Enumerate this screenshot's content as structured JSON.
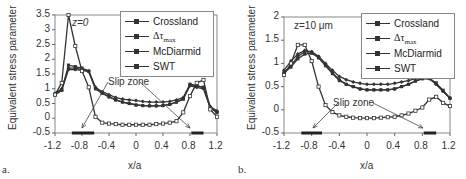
{
  "chart_data": [
    {
      "panel": "a.",
      "type": "line",
      "title": "",
      "annotation": "z=0",
      "slip_zone_label": "Slip zone",
      "xlabel": "x/a",
      "ylabel": "Equivalent stress parameter",
      "xlim": [
        -1.2,
        1.2
      ],
      "ylim": [
        -0.5,
        3.5
      ],
      "xticks": [
        "-1.2",
        "-0.8",
        "-0.4",
        "0",
        "0.4",
        "0.8",
        "1.2"
      ],
      "yticks": [
        "-0.5",
        "0",
        "0.5",
        "1",
        "1.5",
        "2",
        "2.5",
        "3",
        "3.5"
      ],
      "legend_position": "upper right",
      "grid": false,
      "x": [
        -1.2,
        -1.1,
        -1.0,
        -0.9,
        -0.8,
        -0.7,
        -0.6,
        -0.5,
        -0.4,
        -0.3,
        -0.2,
        -0.1,
        0.0,
        0.1,
        0.2,
        0.3,
        0.4,
        0.5,
        0.6,
        0.7,
        0.8,
        0.9,
        1.0,
        1.1,
        1.2
      ],
      "series": [
        {
          "name": "Crossland",
          "values": [
            0.85,
            1.0,
            1.7,
            1.7,
            1.65,
            1.6,
            1.05,
            0.9,
            0.8,
            0.7,
            0.65,
            0.62,
            0.6,
            0.57,
            0.55,
            0.55,
            0.55,
            0.57,
            0.62,
            0.7,
            1.15,
            1.1,
            1.05,
            0.4,
            0.25
          ]
        },
        {
          "name": "Δτmax",
          "values": [
            0.8,
            0.95,
            1.65,
            1.65,
            1.62,
            1.58,
            1.0,
            0.85,
            0.72,
            0.62,
            0.55,
            0.5,
            0.45,
            0.43,
            0.42,
            0.42,
            0.43,
            0.47,
            0.55,
            0.65,
            1.1,
            1.05,
            1.0,
            0.35,
            0.2
          ]
        },
        {
          "name": "McDiarmid",
          "values": [
            0.8,
            0.95,
            1.8,
            1.75,
            1.7,
            1.6,
            1.0,
            0.85,
            0.73,
            0.62,
            0.55,
            0.5,
            0.45,
            0.43,
            0.42,
            0.42,
            0.43,
            0.47,
            0.55,
            0.65,
            1.15,
            1.1,
            1.05,
            0.35,
            0.2
          ]
        },
        {
          "name": "SWT",
          "values": [
            0.8,
            1.2,
            3.5,
            2.45,
            1.6,
            1.05,
            0.05,
            -0.15,
            -0.18,
            -0.2,
            -0.22,
            -0.22,
            -0.22,
            -0.22,
            -0.22,
            -0.2,
            -0.18,
            -0.15,
            -0.1,
            0.2,
            0.75,
            1.2,
            1.3,
            0.3,
            0.05
          ]
        }
      ],
      "slip_zones": [
        [
          -0.95,
          -0.62
        ],
        [
          0.82,
          1.0
        ]
      ]
    },
    {
      "panel": "b.",
      "type": "line",
      "title": "",
      "annotation": "z=10 μm",
      "slip_zone_label": "Slip zone",
      "xlabel": "x/a",
      "ylabel": "Equivalent stress parameter",
      "xlim": [
        -1.2,
        1.2
      ],
      "ylim": [
        -0.5,
        2
      ],
      "xticks": [
        "-1.2",
        "-0.8",
        "-0.4",
        "0",
        "0.4",
        "0.8",
        "1.2"
      ],
      "yticks": [
        "-0.5",
        "0",
        "0.5",
        "1",
        "1.5",
        "2"
      ],
      "legend_position": "upper right",
      "grid": false,
      "x": [
        -1.2,
        -1.1,
        -1.0,
        -0.9,
        -0.8,
        -0.7,
        -0.6,
        -0.5,
        -0.4,
        -0.3,
        -0.2,
        -0.1,
        0.0,
        0.1,
        0.2,
        0.3,
        0.4,
        0.5,
        0.6,
        0.7,
        0.8,
        0.9,
        1.0,
        1.1,
        1.2
      ],
      "series": [
        {
          "name": "Crossland",
          "values": [
            0.85,
            1.05,
            1.2,
            1.28,
            1.25,
            1.15,
            1.0,
            0.85,
            0.72,
            0.65,
            0.6,
            0.57,
            0.55,
            0.55,
            0.55,
            0.55,
            0.57,
            0.6,
            0.63,
            0.67,
            0.68,
            0.67,
            0.55,
            0.4,
            0.25
          ]
        },
        {
          "name": "Δτmax",
          "values": [
            0.8,
            0.95,
            1.15,
            1.25,
            1.25,
            1.15,
            0.98,
            0.8,
            0.65,
            0.55,
            0.5,
            0.45,
            0.43,
            0.43,
            0.43,
            0.43,
            0.45,
            0.5,
            0.55,
            0.62,
            0.67,
            0.68,
            0.55,
            0.4,
            0.25
          ]
        },
        {
          "name": "McDiarmid",
          "values": [
            0.8,
            0.92,
            1.1,
            1.2,
            1.22,
            1.12,
            0.95,
            0.78,
            0.63,
            0.55,
            0.5,
            0.45,
            0.43,
            0.43,
            0.43,
            0.43,
            0.45,
            0.5,
            0.55,
            0.62,
            0.67,
            0.68,
            0.58,
            0.42,
            0.25
          ]
        },
        {
          "name": "SWT",
          "values": [
            0.75,
            1.0,
            1.4,
            1.4,
            1.05,
            0.5,
            0.1,
            -0.05,
            -0.12,
            -0.15,
            -0.17,
            -0.18,
            -0.18,
            -0.18,
            -0.17,
            -0.16,
            -0.15,
            -0.12,
            -0.08,
            -0.02,
            0.05,
            0.22,
            0.28,
            0.15,
            0.08
          ]
        }
      ],
      "slip_zones": [
        [
          -0.95,
          -0.65
        ],
        [
          0.82,
          1.0
        ]
      ]
    }
  ],
  "panels": [
    {
      "label": "a.",
      "z_label": "z=0",
      "ylabel": "Equivalent stress parameter",
      "xlabel": "x/a",
      "slip_zone": "Slip zone",
      "xticks": [
        "-1.2",
        "-0.8",
        "-0.4",
        "0",
        "0.4",
        "0.8",
        "1.2"
      ],
      "yticks": [
        "3.5",
        "3",
        "2.5",
        "2",
        "1.5",
        "1",
        "0.5",
        "0",
        "-0.5"
      ],
      "legend": [
        "Crossland",
        "Δτmax",
        "McDiarmid",
        "SWT"
      ]
    },
    {
      "label": "b.",
      "z_label": "z=10 μm",
      "ylabel": "Equivalent stress parameter",
      "xlabel": "x/a",
      "slip_zone": "Slip zone",
      "xticks": [
        "-1.2",
        "-0.8",
        "-0.4",
        "0",
        "0.4",
        "0.8",
        "1.2"
      ],
      "yticks": [
        "2",
        "1.5",
        "1",
        "0.5",
        "0",
        "-0.5"
      ],
      "legend": [
        "Crossland",
        "Δτmax",
        "McDiarmid",
        "SWT"
      ]
    }
  ],
  "colors": {
    "line": "#333333",
    "axis": "#666666",
    "frame": "#888888"
  }
}
